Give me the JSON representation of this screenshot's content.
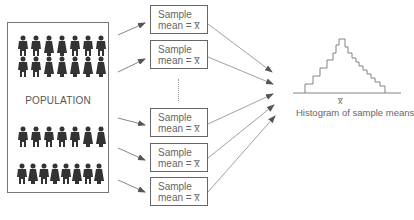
{
  "population": {
    "label": "POPULATION",
    "rows": [
      {
        "count": 7,
        "top": 12
      },
      {
        "count": 7,
        "top": 33
      },
      {
        "count": 7,
        "top": 103
      },
      {
        "count": 8,
        "top": 140
      }
    ]
  },
  "samples": [
    {
      "line1": "Sample",
      "line2": "mean = x̅",
      "top": 5
    },
    {
      "line1": "Sample",
      "line2": "mean = x̅",
      "top": 40
    },
    {
      "line1": "Sample",
      "line2": "mean = x̅",
      "top": 108
    },
    {
      "line1": "Sample",
      "line2": "mean = x̅",
      "top": 143
    },
    {
      "line1": "Sample",
      "line2": "mean = x̅",
      "top": 177
    }
  ],
  "ellipsis": "⋮",
  "histogram": {
    "x_label": "x̅",
    "caption": "Histogram of sample means"
  },
  "colors": {
    "line": "#666666",
    "figure": "#333333"
  }
}
